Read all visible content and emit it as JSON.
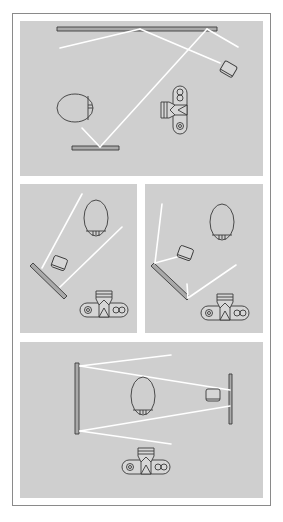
{
  "figure": {
    "colors": {
      "panel_bg": "#cfcfcf",
      "ray": "#ffffff",
      "outline": "#3a3a3a",
      "reflector_fill": "#a9a9a9",
      "frame_border": "#8a8a8a"
    },
    "panels": [
      {
        "id": "top",
        "box": [
          20,
          21,
          243,
          155
        ],
        "reflectors": [
          {
            "points": "57,27 217,27 217,31 57,31",
            "label": "large-reflector-top"
          },
          {
            "points": "72,146 119,146 119,150 72,150",
            "label": "small-reflector-bottom"
          }
        ],
        "rays": [
          "140,29 60,48",
          "140,29 220,63",
          "207,29 238,47",
          "207,29 100,147",
          "100,147 82,128"
        ],
        "subject": {
          "type": "head-side",
          "cx": 75,
          "cy": 108,
          "rx": 18,
          "ry": 14
        },
        "flash": {
          "cx": 228,
          "cy": 70,
          "angle": 30
        },
        "camera": {
          "cx": 175,
          "cy": 110,
          "angle": -90
        }
      },
      {
        "id": "middle-left",
        "box": [
          20,
          184,
          117,
          149
        ],
        "reflectors": [
          {
            "points": "30,266 33,263 67,296 64,299",
            "label": "angled-reflector"
          }
        ],
        "rays": [
          "82,194 42,268",
          "60,287 122,227"
        ],
        "subject": {
          "type": "head-top",
          "cx": 96,
          "cy": 218,
          "rx": 12,
          "ry": 18
        },
        "flash": {
          "cx": 59,
          "cy": 264,
          "angle": 20
        },
        "camera": {
          "cx": 104,
          "cy": 305,
          "angle": 0
        }
      },
      {
        "id": "middle-right",
        "box": [
          145,
          184,
          118,
          149
        ],
        "reflectors": [
          {
            "points": "151,266 154,263 190,297 187,300",
            "label": "angled-reflector"
          }
        ],
        "rays": [
          "162,204 155,263",
          "155,263 177,257",
          "187,284 188,298",
          "188,298 236,265"
        ],
        "subject": {
          "type": "head-top",
          "cx": 222,
          "cy": 222,
          "rx": 12,
          "ry": 18
        },
        "flash": {
          "cx": 185,
          "cy": 254,
          "angle": 20
        },
        "camera": {
          "cx": 225,
          "cy": 308,
          "angle": 0
        }
      },
      {
        "id": "bottom",
        "box": [
          20,
          342,
          243,
          156
        ],
        "reflectors": [
          {
            "points": "75,363 79,363 79,434 75,434",
            "label": "reflector-left"
          },
          {
            "points": "229,374 232,374 232,424 229,424",
            "label": "reflector-right"
          }
        ],
        "rays": [
          "80,366 171,355",
          "80,366 230,390",
          "80,431 171,444",
          "80,431 230,406"
        ],
        "subject": {
          "type": "head-top",
          "cx": 143,
          "cy": 396,
          "rx": 12,
          "ry": 19
        },
        "flash": {
          "cx": 213,
          "cy": 396,
          "angle": 0
        },
        "camera": {
          "cx": 146,
          "cy": 462,
          "angle": 0
        }
      }
    ]
  }
}
